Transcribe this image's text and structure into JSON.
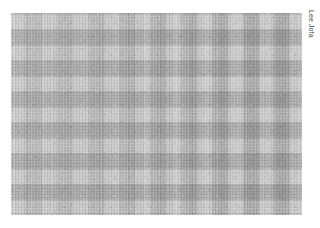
{
  "page": {
    "background_color": "#ffffff",
    "width": 320,
    "height": 228
  },
  "swatch": {
    "name": "gingham-check-fabric-swatch",
    "alt_text": "Grey gingham buffalo check woven fabric",
    "pattern_type": "gingham check",
    "colorway": "grey",
    "x": 11,
    "y": 13,
    "width": 291,
    "height": 202,
    "check_repeat_px": 31,
    "cell_size_px": 15,
    "colors": {
      "light_cell": "#c8c8c8",
      "medium_band": "#ababab",
      "dark_intersection": "#909090",
      "thread_highlight": "#dcdcdc",
      "thread_shadow": "#7d7d7d"
    }
  },
  "credit": {
    "label": "Lee Jofa",
    "rotation_degrees": 90,
    "color": "#4a4a4a"
  }
}
